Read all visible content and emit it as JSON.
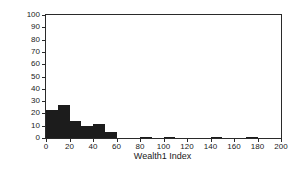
{
  "chart_data": {
    "type": "bar",
    "title": "",
    "subtitle": "",
    "xlabel": "Wealth1 Index",
    "ylabel": "Count",
    "xlim": [
      0,
      200
    ],
    "ylim": [
      0,
      100
    ],
    "bin_width": 10,
    "grid": false,
    "legend": null,
    "bar_color": "#1c1c1c",
    "axis_color": "#2a2a2a",
    "background": "#ffffff",
    "xticks": [
      0,
      20,
      40,
      60,
      80,
      100,
      120,
      140,
      160,
      180,
      200
    ],
    "xtick_labels": [
      "0",
      "20",
      "40",
      "60",
      "80",
      "100",
      "120",
      "140",
      "160",
      "180",
      "200"
    ],
    "yticks": [
      0,
      10,
      20,
      30,
      40,
      50,
      60,
      70,
      80,
      90,
      100
    ],
    "ytick_labels": [
      "0",
      "10",
      "20",
      "30",
      "40",
      "50",
      "60",
      "70",
      "80",
      "90",
      "100"
    ],
    "bins": [
      {
        "x0": 0,
        "x1": 10,
        "value": 23
      },
      {
        "x0": 10,
        "x1": 20,
        "value": 27
      },
      {
        "x0": 20,
        "x1": 30,
        "value": 14
      },
      {
        "x0": 30,
        "x1": 40,
        "value": 10
      },
      {
        "x0": 40,
        "x1": 50,
        "value": 11
      },
      {
        "x0": 50,
        "x1": 60,
        "value": 5
      },
      {
        "x0": 60,
        "x1": 70,
        "value": 0
      },
      {
        "x0": 70,
        "x1": 80,
        "value": 0
      },
      {
        "x0": 80,
        "x1": 90,
        "value": 1
      },
      {
        "x0": 90,
        "x1": 100,
        "value": 0
      },
      {
        "x0": 100,
        "x1": 110,
        "value": 1
      },
      {
        "x0": 110,
        "x1": 120,
        "value": 0
      },
      {
        "x0": 120,
        "x1": 130,
        "value": 0
      },
      {
        "x0": 130,
        "x1": 140,
        "value": 0
      },
      {
        "x0": 140,
        "x1": 150,
        "value": 1
      },
      {
        "x0": 150,
        "x1": 160,
        "value": 0
      },
      {
        "x0": 160,
        "x1": 170,
        "value": 0
      },
      {
        "x0": 170,
        "x1": 180,
        "value": 1
      },
      {
        "x0": 180,
        "x1": 190,
        "value": 0
      },
      {
        "x0": 190,
        "x1": 200,
        "value": 0
      }
    ]
  }
}
